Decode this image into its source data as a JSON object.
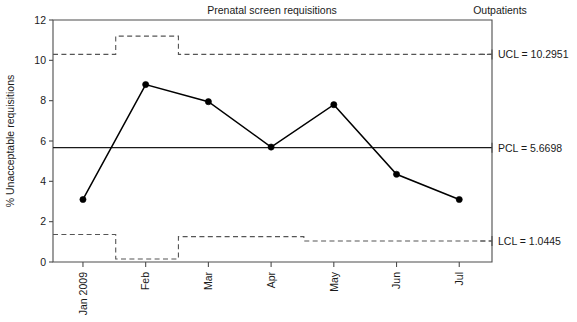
{
  "chart_data": {
    "type": "line",
    "title": "Prenatal screen requisitions",
    "panel_label": "Outpatients",
    "xlabel": "",
    "ylabel": "% Unacceptable requisitions",
    "categories": [
      "Jan 2009",
      "Feb",
      "Mar",
      "Apr",
      "May",
      "Jun",
      "Jul"
    ],
    "values": [
      3.1,
      8.8,
      7.95,
      5.7,
      7.8,
      4.35,
      3.1
    ],
    "series": [
      {
        "name": "% Unacceptable requisitions",
        "values": [
          3.1,
          8.8,
          7.95,
          5.7,
          7.8,
          4.35,
          3.1
        ]
      }
    ],
    "ylim": [
      0,
      12
    ],
    "yticks": [
      0,
      2,
      4,
      6,
      8,
      10,
      12
    ],
    "ytick_labels": [
      "0",
      "2",
      "4",
      "6",
      "8",
      "10",
      "12"
    ],
    "grid": false,
    "legend": "none",
    "control_limits": {
      "ucl": {
        "label": "UCL = 10.2951",
        "value": 10.2951,
        "step_values": [
          10.2951,
          11.2,
          10.2951,
          10.2951,
          10.2951,
          10.2951,
          10.2951
        ]
      },
      "pcl": {
        "label": "PCL = 5.6698",
        "value": 5.6698
      },
      "lcl": {
        "label": "LCL = 1.0445",
        "value": 1.0445,
        "step_values": [
          1.36,
          0.15,
          1.26,
          1.26,
          1.0445,
          1.0445,
          1.0445
        ]
      }
    },
    "colors": {
      "line": "#000000",
      "marker": "#000000",
      "axis": "#4d4d4d",
      "limit_dashed": "#555555",
      "center_line": "#1a1a1a",
      "background": "#ffffff"
    }
  }
}
